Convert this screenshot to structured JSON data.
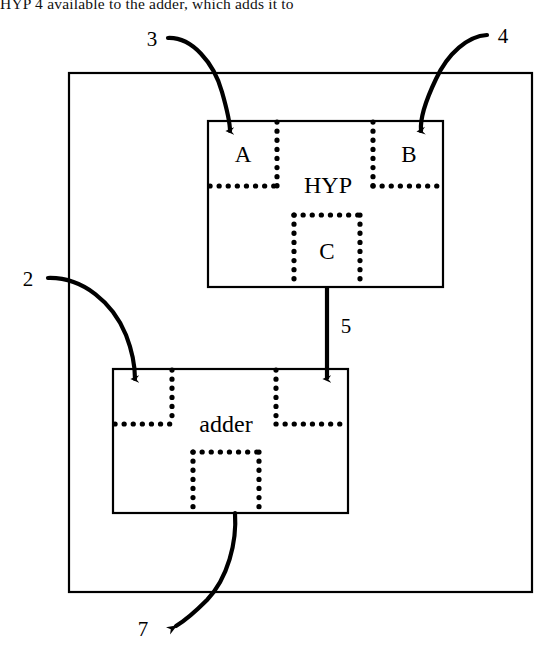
{
  "figure": {
    "caption_top": "HYP",
    "caption_full": "HYP   4  available to the adder, which adds it to",
    "outer_block": {
      "name": "system-boundary"
    },
    "blocks": [
      {
        "id": "hyp",
        "label": "HYP",
        "ports": [
          {
            "id": "hyp-port-a",
            "label": "A"
          },
          {
            "id": "hyp-port-b",
            "label": "B"
          },
          {
            "id": "hyp-port-c",
            "label": "C"
          }
        ]
      },
      {
        "id": "adder",
        "label": "adder",
        "ports": [
          {
            "id": "adder-port-left",
            "label": ""
          },
          {
            "id": "adder-port-right",
            "label": ""
          },
          {
            "id": "adder-port-bottom",
            "label": ""
          }
        ]
      }
    ],
    "signals": [
      {
        "id": "signal-3",
        "label": "3",
        "from": "outside",
        "to": "hyp-port-a"
      },
      {
        "id": "signal-4",
        "label": "4",
        "from": "outside",
        "to": "hyp-port-b"
      },
      {
        "id": "signal-5",
        "label": "5",
        "from": "hyp-port-c",
        "to": "adder-port-right"
      },
      {
        "id": "signal-2",
        "label": "2",
        "from": "outside",
        "to": "adder-port-left"
      },
      {
        "id": "signal-7",
        "label": "7",
        "from": "adder-port-bottom",
        "to": "outside"
      }
    ],
    "colors": {
      "line": "#000000",
      "background": "#ffffff"
    }
  }
}
